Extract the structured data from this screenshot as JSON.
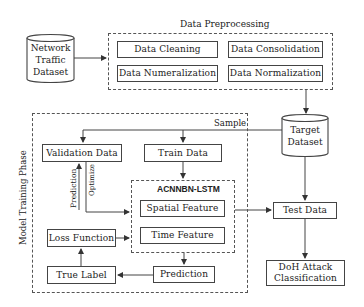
{
  "diagram": {
    "source": {
      "label_line1": "Network",
      "label_line2": "Traffic",
      "label_line3": "Dataset"
    },
    "preprocessing": {
      "title": "Data Preprocessing",
      "steps": [
        {
          "label": "Data Cleaning"
        },
        {
          "label": "Data Consolidation"
        },
        {
          "label": "Data Numeralization"
        },
        {
          "label": "Data Normalization"
        }
      ]
    },
    "target": {
      "label_line1": "Target",
      "label_line2": "Dataset"
    },
    "training": {
      "title": "Model Training Phase",
      "sample_label": "Sample",
      "validation": "Validation Data",
      "train": "Train Data",
      "prediction_edge": "Prediction",
      "optimize_edge": "Optimize",
      "model": {
        "title": "ACNNBN-LSTM",
        "spatial": "Spatial Feature",
        "time": "Time Feature"
      },
      "loss": "Loss Function",
      "true_label": "True Label",
      "prediction": "Prediction"
    },
    "test": "Test Data",
    "output": {
      "label_line1": "DoH Attack",
      "label_line2": "Classification"
    }
  },
  "colors": {
    "line": "#444444",
    "background": "#ffffff",
    "text": "#222222"
  }
}
